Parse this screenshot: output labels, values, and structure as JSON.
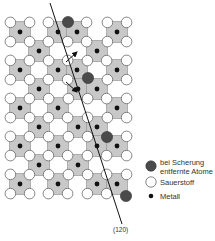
{
  "diagram": {
    "title": "",
    "plane_label": "(120)",
    "colors": {
      "octahedron_fill": "#c8c8c8",
      "octahedron_stroke": "#8a8a8a",
      "oxygen_fill": "#ffffff",
      "oxygen_stroke": "#555555",
      "metal": "#111111",
      "removed_atom": "#4a4a4a",
      "line": "#111111"
    },
    "grid": {
      "metal_rows": [
        {
          "y": 32,
          "x": [
            20,
            58,
            77,
            117
          ]
        },
        {
          "y": 51,
          "x": [
            39,
            97
          ]
        },
        {
          "y": 70,
          "x": [
            20,
            58,
            77,
            117
          ]
        },
        {
          "y": 89,
          "x": [
            39,
            78,
            97
          ]
        },
        {
          "y": 108,
          "x": [
            20,
            58,
            117
          ]
        },
        {
          "y": 127,
          "x": [
            39,
            78,
            97
          ]
        },
        {
          "y": 146,
          "x": [
            20,
            58,
            97,
            117
          ]
        },
        {
          "y": 165,
          "x": [
            39,
            78
          ]
        },
        {
          "y": 184,
          "x": [
            20,
            58,
            97,
            117
          ]
        }
      ],
      "removed_atoms": [
        {
          "x": 68,
          "y": 22
        },
        {
          "x": 88,
          "y": 78
        },
        {
          "x": 107,
          "y": 137
        },
        {
          "x": 126,
          "y": 196
        }
      ]
    },
    "shear_line": {
      "x1": 50,
      "y1": 3,
      "x2": 122,
      "y2": 224
    },
    "arrows": [
      {
        "x1": 66,
        "y1": 62,
        "x2": 77,
        "y2": 52,
        "direction": "up-right"
      },
      {
        "x1": 66,
        "y1": 82,
        "x2": 77,
        "y2": 92,
        "direction": "down-right"
      }
    ]
  },
  "legend": {
    "items": [
      {
        "symbol": "removed-atom",
        "line1": "bei Scherung",
        "line2": "entfernte Atome"
      },
      {
        "symbol": "oxygen",
        "line1": "Sauerstoff"
      },
      {
        "symbol": "metal",
        "line1": "Metall"
      }
    ]
  }
}
